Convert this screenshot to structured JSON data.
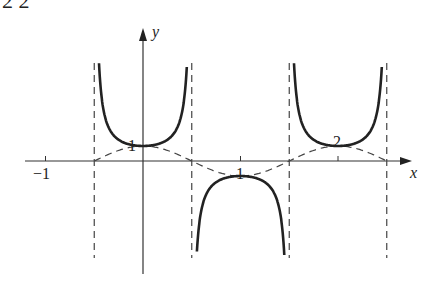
{
  "figure": {
    "top_fragment": "2     2",
    "axis_labels": {
      "x": "x",
      "y": "y"
    },
    "tick_labels": {
      "x_neg1": "−1",
      "x_1": "1",
      "x_2": "2",
      "y_1": "1"
    }
  },
  "chart_data": {
    "type": "line",
    "title": "",
    "xlabel": "x",
    "ylabel": "y",
    "x_ticks": [
      -1,
      1,
      2
    ],
    "y_ticks": [
      1
    ],
    "asymptotes_x": [
      -0.5,
      0.5,
      1.5,
      2.5
    ],
    "series": [
      {
        "name": "sec(πx)",
        "style": "solid",
        "points": [
          [
            0,
            -1
          ],
          [
            1,
            1
          ],
          [
            2,
            -1
          ]
        ]
      },
      {
        "name": "cos(πx)",
        "style": "dashed",
        "points": [
          [
            -0.5,
            0
          ],
          [
            0,
            -1
          ],
          [
            0.5,
            0
          ],
          [
            1,
            1
          ],
          [
            1.5,
            0
          ],
          [
            2,
            -1
          ],
          [
            2.5,
            0
          ]
        ]
      }
    ],
    "grid": false
  }
}
